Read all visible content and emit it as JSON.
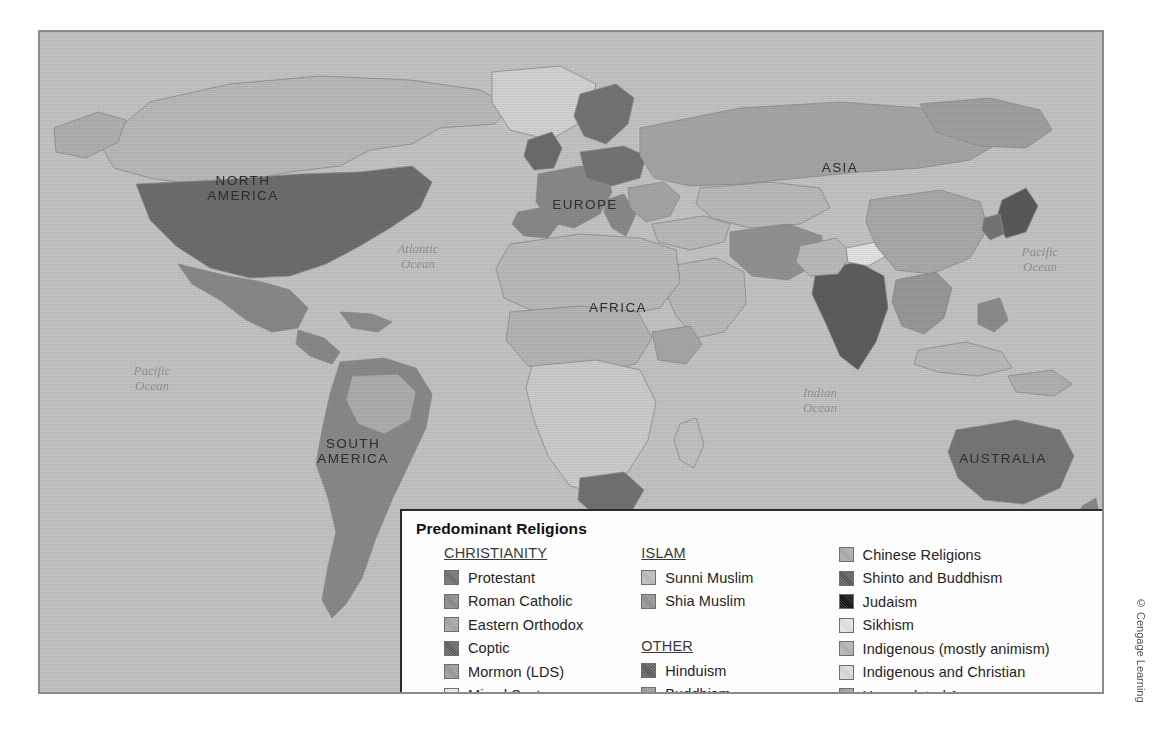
{
  "map": {
    "continent_labels": [
      {
        "name": "north-america",
        "text": "NORTH\nAMERICA",
        "x": 148,
        "y": 141,
        "w": 110
      },
      {
        "name": "south-america",
        "text": "SOUTH\nAMERICA",
        "x": 258,
        "y": 404,
        "w": 110
      },
      {
        "name": "europe",
        "text": "EUROPE",
        "x": 500,
        "y": 165,
        "w": 90
      },
      {
        "name": "africa",
        "text": "AFRICA",
        "x": 533,
        "y": 268,
        "w": 90
      },
      {
        "name": "asia",
        "text": "ASIA",
        "x": 760,
        "y": 128,
        "w": 80
      },
      {
        "name": "australia",
        "text": "AUSTRALIA",
        "x": 908,
        "y": 419,
        "w": 110
      }
    ],
    "ocean_labels": [
      {
        "name": "atlantic-ocean",
        "text": "Atlantic\nOcean",
        "x": 338,
        "y": 209,
        "w": 80
      },
      {
        "name": "pacific-ocean-west",
        "text": "Pacific\nOcean",
        "x": 72,
        "y": 331,
        "w": 80
      },
      {
        "name": "pacific-ocean-east",
        "text": "Pacific\nOcean",
        "x": 960,
        "y": 212,
        "w": 80
      },
      {
        "name": "indian-ocean",
        "text": "Indian\nOcean",
        "x": 740,
        "y": 353,
        "w": 80
      }
    ]
  },
  "legend": {
    "title": "Predominant Religions",
    "columns": [
      {
        "name": "christianity",
        "heading": "CHRISTIANITY",
        "items": [
          {
            "label": "Protestant",
            "color": "#6f6f6f"
          },
          {
            "label": "Roman Catholic",
            "color": "#8b8b8b"
          },
          {
            "label": "Eastern Orthodox",
            "color": "#a8a8a8"
          },
          {
            "label": "Coptic",
            "color": "#626262"
          },
          {
            "label": "Mormon (LDS)",
            "color": "#9c9c9c"
          },
          {
            "label": "Mixed Sects",
            "color": "#ededed"
          }
        ]
      },
      {
        "name": "islam-and-other",
        "heading": "ISLAM",
        "items": [
          {
            "label": "Sunni Muslim",
            "color": "#bdbdbd"
          },
          {
            "label": "Shia Muslim",
            "color": "#949494"
          }
        ],
        "heading2": "OTHER",
        "items2": [
          {
            "label": "Hinduism",
            "color": "#5e5e5e"
          },
          {
            "label": "Buddhism",
            "color": "#9a9a9a"
          }
        ]
      },
      {
        "name": "other-religions",
        "heading": "",
        "items": [
          {
            "label": "Chinese Religions",
            "color": "#acacac"
          },
          {
            "label": "Shinto and Buddhism",
            "color": "#5a5a5a"
          },
          {
            "label": "Judaism",
            "color": "#0d0d0d"
          },
          {
            "label": "Sikhism",
            "color": "#e6e6e6"
          },
          {
            "label": "Indigenous (mostly animism)",
            "color": "#b4b4b4"
          },
          {
            "label": "Indigenous and Christian",
            "color": "#dcdcdc"
          },
          {
            "label": "Unpopulated Areas",
            "color": "#a2a2a2"
          }
        ]
      }
    ]
  },
  "copyright": "© Cengage Learning",
  "colors": {
    "ocean": "#c6c6c6",
    "frame_border": "#8b8b8b",
    "legend_border": "#2b2b2b",
    "legend_background": "#fdfdfd"
  }
}
